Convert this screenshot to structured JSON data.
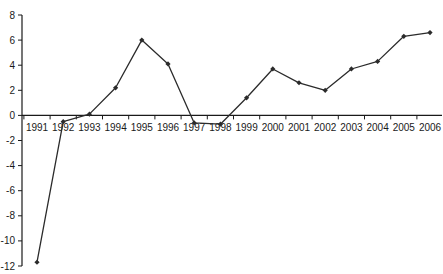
{
  "chart_data": {
    "type": "line",
    "title": "",
    "xlabel": "",
    "ylabel": "",
    "categories": [
      "1991",
      "1992",
      "1993",
      "1994",
      "1995",
      "1996",
      "1997",
      "1998",
      "1999",
      "2000",
      "2001",
      "2002",
      "2003",
      "2004",
      "2005",
      "2006"
    ],
    "series": [
      {
        "name": "",
        "values": [
          -11.7,
          -0.5,
          0.1,
          2.2,
          6.0,
          4.1,
          -0.6,
          -0.7,
          1.4,
          3.7,
          2.6,
          2.0,
          3.7,
          4.3,
          6.3,
          6.6
        ],
        "color": "#2b2b2b",
        "marker": "diamond"
      }
    ],
    "ylim": [
      -12,
      8
    ],
    "yticks": [
      8,
      6,
      4,
      2,
      0,
      -2,
      -4,
      -6,
      -8,
      -10,
      -12
    ],
    "ytick_labels": [
      "8",
      "6",
      "4",
      "2",
      "0",
      "-2",
      "-4",
      "-6",
      "-8",
      "-10",
      "-12"
    ],
    "grid": false,
    "legend": "none",
    "x_axis_at": 0
  },
  "colors": {
    "axis": "#1a1a1a",
    "line": "#2b2b2b",
    "background": "#ffffff"
  }
}
